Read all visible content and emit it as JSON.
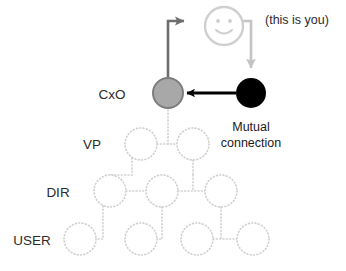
{
  "diagram": {
    "type": "org-chart-network",
    "tier_labels": [
      {
        "id": "cxo",
        "text": "CxO",
        "x": 112,
        "y": 95
      },
      {
        "id": "vp",
        "text": "VP",
        "x": 92,
        "y": 145
      },
      {
        "id": "dir",
        "text": "DIR",
        "x": 58,
        "y": 193
      },
      {
        "id": "user",
        "text": "USER",
        "x": 32,
        "y": 241
      }
    ],
    "nodes": {
      "cxo": {
        "label": "CxO",
        "cx": 168,
        "cy": 93,
        "r": 15,
        "fill": "#a8a8a8",
        "stroke": "#7d7d7d"
      },
      "mutual": {
        "caption_line1": "Mutual",
        "caption_line2": "connection",
        "cx": 251,
        "cy": 93,
        "r": 15,
        "fill": "#000000"
      },
      "you": {
        "label": "(this is you)",
        "cx": 224,
        "cy": 26,
        "r": 19,
        "stroke": "#cfcfcf"
      }
    },
    "captions": {
      "you_label": "(this is you)",
      "mutual_line1": "Mutual",
      "mutual_line2": "connection"
    },
    "colors": {
      "cxo_fill": "#a8a8a8",
      "cxo_stroke": "#7d7d7d",
      "mutual_fill": "#000000",
      "you_stroke": "#cfcfcf",
      "ghost": "#cfcfcf",
      "arrow_dark": "#000000",
      "arrow_gray": "#6e6e6e",
      "arrow_light": "#c4c4c4",
      "text": "#2b2b2b",
      "background": "#ffffff"
    },
    "ghost_tree": {
      "vp_nodes": [
        {
          "cx": 141,
          "cy": 144
        },
        {
          "cx": 193,
          "cy": 144
        }
      ],
      "dir_nodes": [
        {
          "cx": 110,
          "cy": 191
        },
        {
          "cx": 162,
          "cy": 191
        },
        {
          "cx": 221,
          "cy": 191
        }
      ],
      "user_nodes": [
        {
          "cx": 80,
          "cy": 239
        },
        {
          "cx": 141,
          "cy": 239
        },
        {
          "cx": 197,
          "cy": 239
        },
        {
          "cx": 253,
          "cy": 239
        }
      ],
      "ghost_radius": 16
    }
  }
}
